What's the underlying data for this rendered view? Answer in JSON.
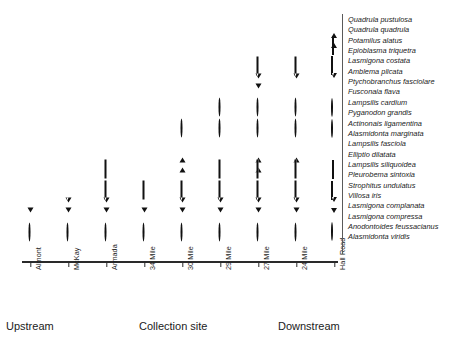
{
  "chart_data": {
    "type": "scatter",
    "title": "",
    "xlabel": "Collection site",
    "ylabel": "",
    "grid": false,
    "legend_position": "right",
    "annotations": [
      "Upstream",
      "Collection site",
      "Downstream"
    ],
    "categories": [
      "Almont",
      "McKay",
      "Armada",
      "34 Mile",
      "30 Mile",
      "29 Mile",
      "27 Mile",
      "24 Mile",
      "Hall Road"
    ],
    "series": [
      {
        "name": "Quadrula pustulosa",
        "marker": "open-triangle-up",
        "sites": []
      },
      {
        "name": "Quadrula quadrula",
        "marker": "filled-triangle-up",
        "sites": []
      },
      {
        "name": "Potamilus alatus",
        "marker": "open-diamond",
        "sites": []
      },
      {
        "name": "Epioblasma triquetra",
        "marker": "filled-diamond",
        "sites": []
      },
      {
        "name": "Lasmigona costata",
        "marker": "open-square",
        "sites": [
          "27 Mile",
          "24 Mile"
        ]
      },
      {
        "name": "Amblema plicata",
        "marker": "filled-square",
        "sites": [
          "27 Mile",
          "24 Mile"
        ]
      },
      {
        "name": "Ptychobranchus fasciolare",
        "marker": "open-triangle-down",
        "sites": [
          "27 Mile",
          "24 Mile"
        ]
      },
      {
        "name": "Fusconaia flava",
        "marker": "filled-triangle-down",
        "sites": [
          "27 Mile"
        ]
      },
      {
        "name": "Lampsilis cardium",
        "marker": "open-circle",
        "sites": [
          "29 Mile",
          "27 Mile",
          "24 Mile"
        ]
      },
      {
        "name": "Pyganodon grandis",
        "marker": "filled-circle",
        "sites": [
          "29 Mile",
          "27 Mile",
          "24 Mile"
        ]
      },
      {
        "name": "Actinonais ligamentina",
        "marker": "open-circle",
        "sites": [
          "30 Mile",
          "29 Mile",
          "27 Mile",
          "24 Mile"
        ]
      },
      {
        "name": "Alasmidonta marginata",
        "marker": "filled-circle",
        "sites": [
          "30 Mile"
        ]
      },
      {
        "name": "Lampsilis fasciola",
        "marker": "open-triangle-up",
        "sites": [
          "30 Mile",
          "27 Mile",
          "24 Mile"
        ]
      },
      {
        "name": "Elliptio dilatata",
        "marker": "filled-triangle-up",
        "sites": [
          "30 Mile",
          "27 Mile"
        ]
      },
      {
        "name": "Lampsilis siliquoidea",
        "marker": "open-diamond",
        "sites": [
          "Armada",
          "29 Mile",
          "27 Mile",
          "24 Mile"
        ]
      },
      {
        "name": "Pleurobema sintoxia",
        "marker": "filled-diamond",
        "sites": [
          "Armada",
          "34 Mile",
          "30 Mile",
          "27 Mile",
          "24 Mile"
        ]
      },
      {
        "name": "Strophitus undulatus",
        "marker": "open-square",
        "sites": [
          "Armada",
          "34 Mile",
          "30 Mile",
          "29 Mile",
          "27 Mile",
          "24 Mile"
        ]
      },
      {
        "name": "Villosa iris",
        "marker": "filled-square",
        "sites": [
          "Armada",
          "34 Mile",
          "30 Mile",
          "29 Mile",
          "27 Mile",
          "24 Mile"
        ]
      },
      {
        "name": "Lasmigona complanata",
        "marker": "open-triangle-down",
        "sites": [
          "McKay",
          "Armada",
          "30 Mile",
          "29 Mile",
          "27 Mile",
          "24 Mile"
        ]
      },
      {
        "name": "Lasmigona compressa",
        "marker": "filled-triangle-down",
        "sites": [
          "Almont",
          "McKay",
          "Armada",
          "34 Mile",
          "30 Mile",
          "29 Mile",
          "27 Mile",
          "24 Mile"
        ]
      },
      {
        "name": "Anodontoides feussacianus",
        "marker": "open-circle",
        "sites": [
          "Almont",
          "McKay",
          "Armada",
          "34 Mile",
          "30 Mile",
          "29 Mile",
          "27 Mile",
          "24 Mile"
        ]
      },
      {
        "name": "Alasmidonta viridis",
        "marker": "filled-circle",
        "sites": [
          "Almont",
          "Armada",
          "34 Mile",
          "30 Mile"
        ]
      }
    ]
  },
  "legend": {
    "entries": [
      {
        "marker": "open-triangle-up",
        "label": "Quadrula pustulosa"
      },
      {
        "marker": "filled-triangle-up",
        "label": "Quadrula quadrula"
      },
      {
        "marker": "open-diamond",
        "label": "Potamilus alatus"
      },
      {
        "marker": "filled-diamond",
        "label": "Epioblasma triquetra"
      },
      {
        "marker": "open-square",
        "label": "Lasmigona costata"
      },
      {
        "marker": "filled-square",
        "label": "Amblema plicata"
      },
      {
        "marker": "open-triangle-down",
        "label": "Ptychobranchus fasciolare"
      },
      {
        "marker": "none",
        "label": "Fusconaia flava"
      },
      {
        "marker": "open-circle",
        "label": "Lampsilis cardium"
      },
      {
        "marker": "filled-circle",
        "label": "Pyganodon grandis"
      },
      {
        "marker": "open-circle",
        "label": "Actinonais ligamentina"
      },
      {
        "marker": "filled-circle",
        "label": "Alasmidonta marginata"
      },
      {
        "marker": "none",
        "label": "Lampsilis fasciola"
      },
      {
        "marker": "none",
        "label": "Elliptio dilatata"
      },
      {
        "marker": "open-diamond",
        "label": "Lampsilis siliquoidea"
      },
      {
        "marker": "filled-diamond",
        "label": "Pleurobema sintoxia"
      },
      {
        "marker": "open-square",
        "label": "Strophitus undulatus"
      },
      {
        "marker": "filled-square",
        "label": "Villosa iris"
      },
      {
        "marker": "open-triangle-down",
        "label": "Lasmigona complanata"
      },
      {
        "marker": "filled-triangle-down",
        "label": "Lasmigona compressa"
      },
      {
        "marker": "open-circle",
        "label": "Anodontoides feussacianus"
      },
      {
        "marker": "none",
        "label": "Alasmidonta viridis"
      }
    ]
  },
  "axis": {
    "ticks": [
      "Almont",
      "McKay",
      "Armada",
      "34 Mile",
      "30 Mile",
      "29 Mile",
      "27 Mile",
      "24 Mile",
      "Hall Road"
    ],
    "upstream_label": "Upstream",
    "title": "Collection site",
    "downstream_label": "Downstream"
  },
  "colors": {
    "marker": "#111111",
    "axis": "#2a2a2a",
    "text": "#1b1b1b",
    "background": "#ffffff"
  }
}
